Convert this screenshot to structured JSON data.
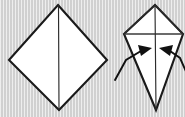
{
  "figure": {
    "type": "instructional-diagram",
    "background_color": "#d9d9d9",
    "paper_color": "#ffffff",
    "line_color": "#1a1a1a",
    "step_count": 2
  },
  "shapes": {
    "left": {
      "name": "diamond-square-base",
      "label": "",
      "outline_points": "58,5 107,60 59,110 9,60",
      "center_crease": "58.5,5 59,110",
      "vertices": {
        "top": [
          58,
          5
        ],
        "right": [
          107,
          60
        ],
        "bottom": [
          59,
          110
        ],
        "left": [
          9,
          60
        ]
      }
    },
    "right": {
      "name": "kite-base",
      "label": "",
      "outline_points": "155,5 183,34 156,110 124,34",
      "center_crease": "155,5 156,110",
      "horizontal_crease": "124,34 183,34",
      "left_fold_crease": "124,34 155,5",
      "right_fold_crease": "183,34 155,5",
      "vertices": {
        "top": [
          155,
          5
        ],
        "right": [
          183,
          34
        ],
        "bottom": [
          156,
          110
        ],
        "left": [
          124,
          34
        ]
      }
    }
  },
  "arrows": [
    {
      "name": "fold-arrow-left",
      "direction": "inward-right",
      "path": "115,80 126,60 141,51",
      "head_points": "152,48 138,45 141,56",
      "label": ""
    },
    {
      "name": "fold-arrow-right",
      "direction": "inward-left",
      "path": "188,76 180,58 170,51",
      "head_points": "159,48 173,45 170,56",
      "label": ""
    }
  ]
}
